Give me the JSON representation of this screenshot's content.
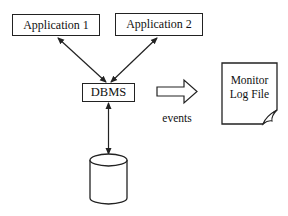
{
  "diagram": {
    "nodes": {
      "app1": {
        "label": "Application 1"
      },
      "app2": {
        "label": "Application 2"
      },
      "dbms": {
        "label": "DBMS"
      },
      "database": {
        "label": ""
      },
      "log": {
        "line1": "Monitor",
        "line2": "Log File"
      }
    },
    "edges": [
      {
        "from": "app1",
        "to": "dbms",
        "type": "bidirectional"
      },
      {
        "from": "app2",
        "to": "dbms",
        "type": "bidirectional"
      },
      {
        "from": "dbms",
        "to": "database",
        "type": "bidirectional"
      },
      {
        "from": "dbms",
        "to": "log",
        "type": "block-arrow",
        "label": "events"
      }
    ],
    "events_label": "events"
  }
}
